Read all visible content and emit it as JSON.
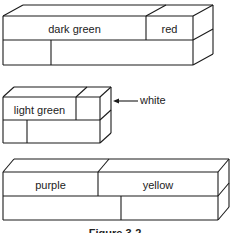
{
  "figure": {
    "caption": "Figure 3-2",
    "stroke_color": "#1a1a1a",
    "background": "#ffffff"
  },
  "trains": [
    {
      "id": "train-1",
      "front": {
        "x": 3,
        "y": 16,
        "w": 190,
        "h": 49
      },
      "depth": {
        "dx": 20,
        "dy": -11
      },
      "row_split_y": 40,
      "top_row": [
        {
          "label": "dark green",
          "x0": 3,
          "x1": 146
        },
        {
          "label": "red",
          "x0": 146,
          "x1": 193
        }
      ],
      "bottom_row": [
        {
          "label": "",
          "x0": 3,
          "x1": 51
        },
        {
          "label": "",
          "x0": 51,
          "x1": 193
        }
      ]
    },
    {
      "id": "train-2",
      "front": {
        "x": 3,
        "y": 97,
        "w": 97,
        "h": 46
      },
      "depth": {
        "dx": 11,
        "dy": -10
      },
      "row_split_y": 120,
      "top_row": [
        {
          "label": "light green",
          "x0": 3,
          "x1": 76
        },
        {
          "label": "",
          "x0": 76,
          "x1": 100
        }
      ],
      "bottom_row": [
        {
          "label": "",
          "x0": 3,
          "x1": 27
        },
        {
          "label": "",
          "x0": 27,
          "x1": 100
        }
      ],
      "callout": {
        "label": "white",
        "arrow_from_x": 138,
        "arrow_to_x": 113,
        "y": 101
      }
    },
    {
      "id": "train-3",
      "front": {
        "x": 3,
        "y": 172,
        "w": 215,
        "h": 48
      },
      "depth": {
        "dx": 11,
        "dy": -13
      },
      "row_split_y": 196,
      "top_row": [
        {
          "label": "purple",
          "x0": 3,
          "x1": 98
        },
        {
          "label": "yellow",
          "x0": 98,
          "x1": 218
        }
      ],
      "bottom_row": [
        {
          "label": "",
          "x0": 3,
          "x1": 121
        },
        {
          "label": "",
          "x0": 121,
          "x1": 218
        }
      ]
    }
  ]
}
